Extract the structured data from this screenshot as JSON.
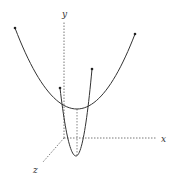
{
  "diagram": {
    "type": "3d-parabolas",
    "axes": {
      "x": {
        "label": "x",
        "from": [
          64,
          138
        ],
        "to": [
          156,
          138
        ],
        "label_pos": [
          161,
          142
        ]
      },
      "y": {
        "label": "y",
        "from": [
          64,
          138
        ],
        "to": [
          64,
          22
        ],
        "label_pos": [
          62,
          17
        ]
      },
      "z": {
        "label": "z",
        "from": [
          64,
          138
        ],
        "to": [
          43,
          162
        ],
        "label_pos": [
          33,
          173
        ]
      }
    },
    "curves": [
      {
        "name": "wide-parabola",
        "start": [
          15,
          28
        ],
        "vertex": [
          77,
          109
        ],
        "end": [
          135,
          34
        ]
      },
      {
        "name": "narrow-parabola",
        "start": [
          60,
          88
        ],
        "vertex": [
          76,
          156
        ],
        "end": [
          92,
          69
        ]
      }
    ],
    "guides": [
      {
        "name": "vertex-drop-line",
        "from": [
          77,
          109
        ],
        "to": [
          77,
          156
        ]
      }
    ],
    "colors": {
      "curve": "#333333",
      "axis": "#555555",
      "point": "#222222"
    }
  }
}
